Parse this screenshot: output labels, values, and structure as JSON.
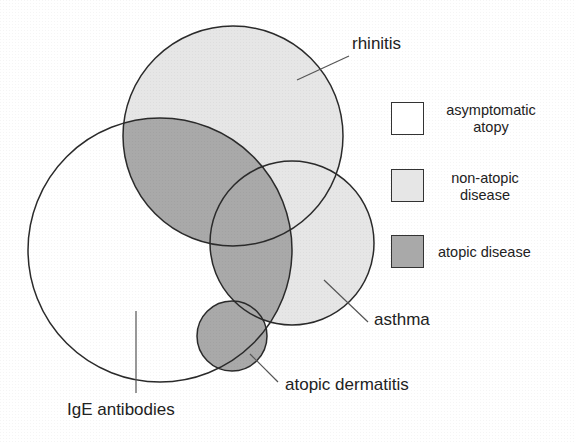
{
  "diagram": {
    "type": "venn",
    "sets": [
      {
        "id": "ige",
        "label": "IgE antibodies",
        "category": "asymptomatic atopy"
      },
      {
        "id": "rhinitis",
        "label": "rhinitis",
        "category": "non-atopic disease"
      },
      {
        "id": "asthma",
        "label": "asthma",
        "category": "non-atopic disease"
      },
      {
        "id": "dermatitis",
        "label": "atopic dermatitis",
        "category": "non-atopic disease"
      }
    ],
    "overlap_rule": "disease regions overlapping IgE antibodies are atopic disease"
  },
  "labels": {
    "rhinitis": "rhinitis",
    "asthma": "asthma",
    "dermatitis": "atopic dermatitis",
    "ige": "IgE antibodies"
  },
  "legend": {
    "items": [
      {
        "line1": "asymptomatic",
        "line2": "atopy",
        "color": "#ffffff"
      },
      {
        "line1": "non-atopic",
        "line2": "disease",
        "color": "#e6e6e6"
      },
      {
        "line1": "atopic disease",
        "line2": "",
        "color": "#a9a9a9"
      }
    ]
  },
  "colors": {
    "light": "#e6e6e6",
    "dark": "#a9a9a9",
    "stroke": "#2a2a2a"
  }
}
